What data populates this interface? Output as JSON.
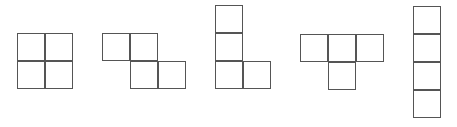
{
  "diagram": {
    "title": "",
    "cell_size": 28,
    "stroke_color": "#555555",
    "fill_color": "#ffffff",
    "shapes": [
      {
        "name": "O-tetromino",
        "cells": [
          [
            17,
            33
          ],
          [
            45,
            33
          ],
          [
            17,
            61
          ],
          [
            45,
            61
          ]
        ]
      },
      {
        "name": "Z-tetromino",
        "cells": [
          [
            102,
            33
          ],
          [
            130,
            33
          ],
          [
            130,
            61
          ],
          [
            158,
            61
          ]
        ]
      },
      {
        "name": "L-tetromino",
        "cells": [
          [
            215,
            5
          ],
          [
            215,
            33
          ],
          [
            215,
            61
          ],
          [
            243,
            61
          ]
        ]
      },
      {
        "name": "T-tetromino",
        "cells": [
          [
            300,
            34
          ],
          [
            328,
            34
          ],
          [
            356,
            34
          ],
          [
            328,
            62
          ]
        ]
      },
      {
        "name": "I-tetromino",
        "cells": [
          [
            413,
            6
          ],
          [
            413,
            34
          ],
          [
            413,
            62
          ],
          [
            413,
            90
          ]
        ]
      }
    ]
  }
}
